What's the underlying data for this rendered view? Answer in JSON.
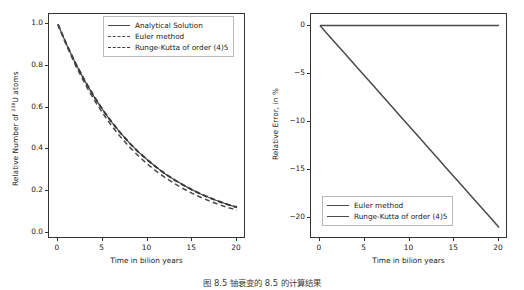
{
  "figure": {
    "caption": "图 8.5   铀衰变的 8.5 的计算结果"
  },
  "panels": [
    {
      "id": "left",
      "xlabel": "Time in bilion years",
      "ylabel_prefix": "Relative Number of ",
      "ylabel_sup": "238",
      "ylabel_suffix": "U atoms",
      "xticks": [
        "0",
        "5",
        "10",
        "15",
        "20"
      ],
      "yticks": [
        "0.0",
        "0.2",
        "0.4",
        "0.6",
        "0.8",
        "1.0"
      ],
      "legend": [
        {
          "label": "Analytical Solution",
          "style": "solid"
        },
        {
          "label": "Euler method",
          "style": "dash"
        },
        {
          "label": "Runge-Kutta of order (4)5",
          "style": "dash-thick"
        }
      ]
    },
    {
      "id": "right",
      "xlabel": "Time in bilion years",
      "ylabel": "Relative Error, in %",
      "xticks": [
        "0",
        "5",
        "10",
        "15",
        "20"
      ],
      "yticks": [
        "0",
        "-5",
        "-10",
        "-15",
        "-20"
      ],
      "legend": [
        {
          "label": "Euler method",
          "style": "solid"
        },
        {
          "label": "Runge-Kutta of order (4)5",
          "style": "solid"
        }
      ]
    }
  ],
  "chart_data": [
    {
      "type": "line",
      "title": "",
      "xlabel": "Time in bilion years",
      "ylabel": "Relative Number of 238U atoms",
      "xlim": [
        -1.0,
        21.0
      ],
      "ylim": [
        -0.03,
        1.05
      ],
      "grid": false,
      "legend_position": "upper right",
      "x": [
        0,
        1,
        2,
        3,
        4,
        5,
        6,
        7,
        8,
        9,
        10,
        11,
        12,
        13,
        14,
        15,
        16,
        17,
        18,
        19,
        20
      ],
      "series": [
        {
          "name": "Analytical Solution",
          "style": "solid",
          "color": "#4a4a4a",
          "values": [
            1.0,
            0.9,
            0.81,
            0.729,
            0.656,
            0.59,
            0.531,
            0.478,
            0.43,
            0.387,
            0.349,
            0.314,
            0.282,
            0.254,
            0.229,
            0.206,
            0.185,
            0.167,
            0.15,
            0.135,
            0.122
          ]
        },
        {
          "name": "Euler method",
          "style": "dashed",
          "color": "#4a4a4a",
          "values": [
            1.0,
            0.895,
            0.8,
            0.716,
            0.641,
            0.574,
            0.513,
            0.459,
            0.411,
            0.368,
            0.329,
            0.295,
            0.264,
            0.236,
            0.211,
            0.189,
            0.169,
            0.151,
            0.135,
            0.121,
            0.108
          ]
        },
        {
          "name": "Runge-Kutta of order (4)5",
          "style": "dashed",
          "color": "#3a3a3a",
          "values": [
            1.0,
            0.9,
            0.81,
            0.729,
            0.656,
            0.59,
            0.531,
            0.478,
            0.43,
            0.387,
            0.349,
            0.314,
            0.282,
            0.254,
            0.229,
            0.206,
            0.185,
            0.167,
            0.15,
            0.135,
            0.122
          ]
        }
      ]
    },
    {
      "type": "line",
      "title": "",
      "xlabel": "Time in bilion years",
      "ylabel": "Relative Error, in %",
      "xlim": [
        -1.0,
        21.0
      ],
      "ylim": [
        -22.2,
        1.2
      ],
      "grid": false,
      "legend_position": "lower left",
      "x": [
        0,
        1,
        2,
        3,
        4,
        5,
        6,
        7,
        8,
        9,
        10,
        11,
        12,
        13,
        14,
        15,
        16,
        17,
        18,
        19,
        20
      ],
      "series": [
        {
          "name": "Euler method",
          "style": "solid",
          "color": "#4a4a4a",
          "values": [
            0.0,
            -1.05,
            -2.1,
            -3.15,
            -4.2,
            -5.25,
            -6.3,
            -7.35,
            -8.4,
            -9.45,
            -10.5,
            -11.55,
            -12.6,
            -13.65,
            -14.7,
            -15.75,
            -16.8,
            -17.85,
            -18.9,
            -19.95,
            -21.0
          ]
        },
        {
          "name": "Runge-Kutta of order (4)5",
          "style": "solid",
          "color": "#4a4a4a",
          "values": [
            0.0,
            0.0,
            0.0,
            0.0,
            0.0,
            0.0,
            0.0,
            0.0,
            0.0,
            0.0,
            0.0,
            0.0,
            0.0,
            0.0,
            0.0,
            0.0,
            0.0,
            0.0,
            0.0,
            0.0,
            0.0
          ]
        }
      ]
    }
  ]
}
